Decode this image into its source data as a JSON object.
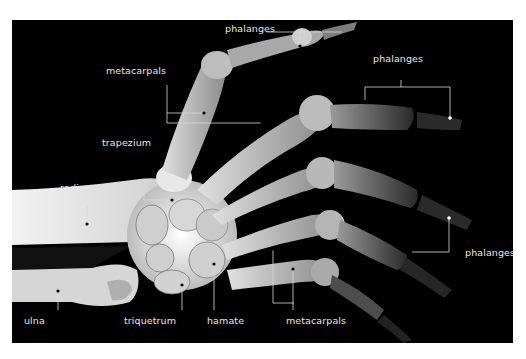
{
  "figure": {
    "background": "#000000",
    "bone_color": "#d9d9d9",
    "annotation_color": "#e6e6e6",
    "labels": {
      "phalanges_top": "phalanges",
      "metacarpals_top": "metacarpals",
      "phalanges_right_upper": "phalanges",
      "trapezium": "trapezium",
      "radius": "radius",
      "phalanges_right_lower": "phalanges",
      "ulna": "ulna",
      "triquetrum": "triquetrum",
      "hamate": "hamate",
      "metacarpals_bottom": "metacarpals"
    }
  }
}
